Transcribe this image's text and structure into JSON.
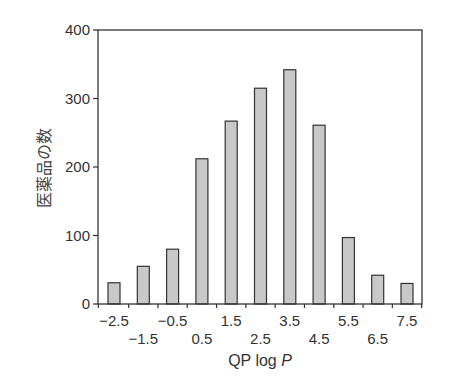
{
  "chart_data": {
    "type": "bar",
    "title": "",
    "xlabel": "QP log P",
    "xlabel_parts": {
      "plain": "QP log ",
      "italic": "P"
    },
    "ylabel": "医薬品の数",
    "ylim": [
      0,
      400
    ],
    "yticks": [
      0,
      100,
      200,
      300,
      400
    ],
    "categories": [
      "-2.5",
      "-1.5",
      "-0.5",
      "0.5",
      "1.5",
      "2.5",
      "3.5",
      "4.5",
      "5.5",
      "6.5",
      "7.5"
    ],
    "category_labels": [
      "−2.5",
      "−1.5",
      "−0.5",
      "0.5",
      "1.5",
      "2.5",
      "3.5",
      "4.5",
      "5.5",
      "6.5",
      "7.5"
    ],
    "values": [
      31,
      55,
      80,
      212,
      267,
      315,
      342,
      261,
      97,
      42,
      30
    ],
    "grid": false,
    "legend": null,
    "bar_color": "#c8c8c8",
    "bar_edge_color": "#333333"
  }
}
